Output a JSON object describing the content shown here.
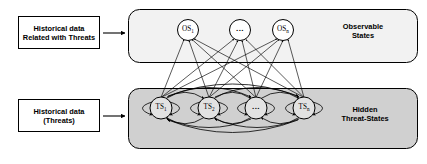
{
  "figure": {
    "background_color": "#ffffff",
    "line_color": "#000000",
    "region_fill_top": "#f2f2f2",
    "region_fill_bottom": "#d0d0d0",
    "node_fill": "#ffffff"
  },
  "input_boxes": [
    {
      "id": "box-observable-input",
      "line1": "Historical data",
      "line2": "Related with Threats",
      "x": 18,
      "y": 16,
      "width": 82,
      "height": 33,
      "arrow_to": "observable-region"
    },
    {
      "id": "box-threats-input",
      "line1": "Historical data",
      "line2": "(Threats)",
      "x": 18,
      "y": 99,
      "width": 82,
      "height": 33,
      "arrow_to": "hidden-region"
    }
  ],
  "regions": [
    {
      "id": "observable-region",
      "label_line1": "Observable",
      "label_line2": "States",
      "label_x": 362,
      "label_y": 27,
      "x": 128,
      "y": 9,
      "width": 290,
      "height": 54,
      "fill": "#f2f2f2"
    },
    {
      "id": "hidden-region",
      "label_line1": "Hidden",
      "label_line2": "Threat-States",
      "label_x": 362,
      "label_y": 110,
      "x": 128,
      "y": 88,
      "width": 290,
      "height": 61,
      "fill": "#d0d0d0"
    }
  ],
  "observable_nodes": [
    {
      "id": "os-1",
      "label": "OS",
      "sub": "1",
      "cx": 188,
      "cy": 30,
      "r": 10.5
    },
    {
      "id": "os-mid",
      "label": "...",
      "sub": "",
      "cx": 240,
      "cy": 30,
      "r": 10.5
    },
    {
      "id": "os-n",
      "label": "OS",
      "sub": "n",
      "cx": 283,
      "cy": 30,
      "r": 10.5
    }
  ],
  "hidden_nodes": [
    {
      "id": "ts-1",
      "label": "TS",
      "sub": "1",
      "cx": 161,
      "cy": 108,
      "r": 11
    },
    {
      "id": "ts-2",
      "label": "TS",
      "sub": "2",
      "cx": 209,
      "cy": 108,
      "r": 11
    },
    {
      "id": "ts-mid",
      "label": "...",
      "sub": "",
      "cx": 256,
      "cy": 108,
      "r": 11
    },
    {
      "id": "ts-n",
      "label": "TS",
      "sub": "n",
      "cx": 304,
      "cy": 108,
      "r": 11
    }
  ],
  "edges": {
    "emission_description": "Each hidden threat-state emits arrows upward to every observable state",
    "transition_description": "Bidirectional transition arcs connect every pair of hidden threat-states",
    "self_loop_description": "Each hidden threat-state has left and right self-loops"
  }
}
